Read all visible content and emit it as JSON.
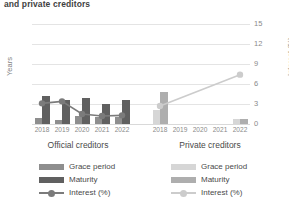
{
  "chart": {
    "title": "and private creditors",
    "ylabel_left": "Years",
    "ylabel_right": "Interest (%)",
    "group_left": "Official creditors",
    "group_right": "Private creditors"
  },
  "axes": {
    "left_ticks": [
      "0",
      "10",
      "20",
      "30",
      "40",
      "50"
    ],
    "right_ticks": [
      "0",
      "3",
      "6",
      "9",
      "12",
      "15"
    ]
  },
  "legend_official": {
    "grace": "Grace period",
    "maturity": "Maturity",
    "interest": "Interest (%)"
  },
  "legend_private": {
    "grace": "Grace period",
    "maturity": "Maturity",
    "interest": "Interest (%)"
  },
  "colors": {
    "grace_official": "#8e8e8e",
    "maturity_official": "#606060",
    "interest_official": "#7b7b7b",
    "grace_private": "#d6d6d6",
    "maturity_private": "#aeaeae",
    "interest_private": "#cccccc",
    "grid": "#e4e4e4",
    "text": "#595959"
  },
  "chart_data": {
    "type": "bar",
    "title": "and private creditors",
    "xlabel": "",
    "ylabel": "Years",
    "ylabel_secondary": "Interest (%)",
    "ylim": [
      0,
      50
    ],
    "ylim_secondary": [
      0,
      15
    ],
    "grid": true,
    "legend_position": "bottom",
    "groups": [
      {
        "name": "Official creditors",
        "categories": [
          "2018",
          "2019",
          "2020",
          "2021",
          "2022"
        ],
        "series": [
          {
            "name": "Grace period",
            "axis": "left",
            "unit": "years",
            "values": [
              3.0,
              2.0,
              4.0,
              3.5,
              3.5
            ]
          },
          {
            "name": "Maturity",
            "axis": "left",
            "unit": "years",
            "values": [
              14.0,
              12.0,
              13.0,
              10.0,
              12.0
            ]
          },
          {
            "name": "Interest (%)",
            "axis": "right",
            "unit": "percent",
            "values": [
              3.1,
              3.4,
              1.5,
              1.2,
              1.3
            ]
          }
        ]
      },
      {
        "name": "Private creditors",
        "categories": [
          "2018",
          "2019",
          "2020",
          "2021",
          "2022"
        ],
        "series": [
          {
            "name": "Grace period",
            "axis": "left",
            "unit": "years",
            "values": [
              7.0,
              null,
              null,
              null,
              2.5
            ]
          },
          {
            "name": "Maturity",
            "axis": "left",
            "unit": "years",
            "values": [
              16.0,
              null,
              null,
              null,
              2.5
            ]
          },
          {
            "name": "Interest (%)",
            "axis": "right",
            "unit": "percent",
            "values": [
              2.7,
              null,
              null,
              null,
              7.4
            ]
          }
        ]
      }
    ]
  }
}
